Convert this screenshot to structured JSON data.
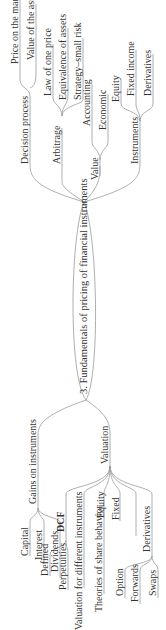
{
  "title": "3. Fundamentals of pricing of financial instruments",
  "colors": {
    "line": "#9a9a9a",
    "text": "#333333",
    "background": "#ffffff"
  },
  "right_branch": {
    "decision_process": {
      "label": "Decision process",
      "children": [
        "Price on the market",
        "Value of the asset"
      ]
    },
    "arbitrage": {
      "label": "Arbitrage",
      "children": [
        "Law of one price",
        "Equivalence of assets",
        "Strategy–small risk"
      ]
    },
    "value": {
      "label": "Value",
      "children": [
        "Accounting",
        "Economic"
      ]
    },
    "instruments": {
      "label": "Instruments",
      "children": [
        "Equity",
        "Fixed income",
        "Derivatives"
      ]
    }
  },
  "left_branch": {
    "gains": {
      "label": "Gains on instruments",
      "children": [
        "Capital",
        "Interest",
        "Dividends"
      ]
    },
    "valuation": {
      "label": "Valuation",
      "dcf": {
        "label": "DCF",
        "children": [
          "Defined",
          "Perpetuities"
        ]
      },
      "valuation_for_different": "Valuation for different instruments",
      "theories": "Theories of share behavior",
      "equity": "Equity",
      "fixed": "Fixed",
      "derivatives": {
        "label": "Derivatives",
        "children": [
          "Option",
          "Forwards",
          "Swaps"
        ]
      }
    }
  }
}
